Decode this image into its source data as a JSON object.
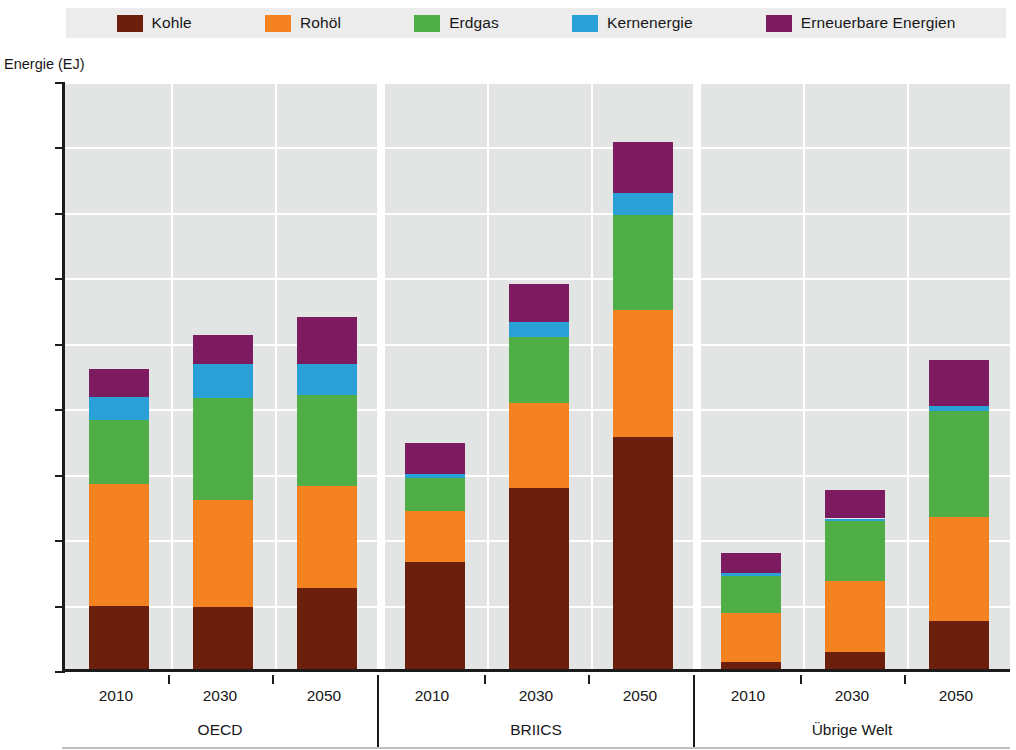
{
  "chart_data": {
    "type": "bar",
    "subtype": "stacked-bar-grouped",
    "title": "",
    "xlabel": "",
    "ylabel": "Energie (EJ)",
    "ylim": [
      0,
      450
    ],
    "ytick_step": 50,
    "yticks": [
      0,
      50,
      100,
      150,
      200,
      250,
      300,
      350,
      400,
      450
    ],
    "grid": "horizontal-and-vertical",
    "legend_position": "top",
    "groups": [
      "OECD",
      "BRIICS",
      "Übrige Welt"
    ],
    "categories": [
      "2010",
      "2030",
      "2050",
      "2010",
      "2030",
      "2050",
      "2010",
      "2030",
      "2050"
    ],
    "series": [
      {
        "name": "Kohle",
        "color": "#6B1F0C",
        "values": [
          48,
          47,
          62,
          82,
          138,
          177,
          5,
          13,
          37
        ]
      },
      {
        "name": "Rohöl",
        "color": "#F58220",
        "values": [
          93,
          82,
          78,
          39,
          65,
          97,
          38,
          54,
          79
        ]
      },
      {
        "name": "Erdgas",
        "color": "#4FAF46",
        "values": [
          49,
          78,
          69,
          25,
          51,
          73,
          28,
          46,
          81
        ]
      },
      {
        "name": "Kernenergie",
        "color": "#29A0D6",
        "values": [
          18,
          26,
          24,
          3,
          11,
          17,
          2,
          2,
          4
        ]
      },
      {
        "name": "Erneuerbare Energien",
        "color": "#7C1B60",
        "values": [
          21,
          22,
          36,
          24,
          29,
          39,
          16,
          22,
          35
        ]
      }
    ],
    "totals": [
      229,
      255,
      269,
      173,
      294,
      403,
      89,
      137,
      236
    ]
  },
  "legend": {
    "items": [
      {
        "label": "Kohle",
        "color": "#6B1F0C",
        "icon": "legend-swatch-icon"
      },
      {
        "label": "Rohöl",
        "color": "#F58220",
        "icon": "legend-swatch-icon"
      },
      {
        "label": "Erdgas",
        "color": "#4FAF46",
        "icon": "legend-swatch-icon"
      },
      {
        "label": "Kernenergie",
        "color": "#29A0D6",
        "icon": "legend-swatch-icon"
      },
      {
        "label": "Erneuerbare Energien",
        "color": "#7C1B60",
        "icon": "legend-swatch-icon"
      }
    ]
  },
  "axes": {
    "y_axis_title": "Energie (EJ)",
    "y_tick_labels": [
      "450",
      "400",
      "350",
      "300",
      "250",
      "200",
      "150",
      "100",
      "50",
      "0"
    ],
    "x_tick_labels": [
      "2010",
      "2030",
      "2050",
      "2010",
      "2030",
      "2050",
      "2010",
      "2030",
      "2050"
    ],
    "x_group_labels": [
      "OECD",
      "BRIICS",
      "Übrige Welt"
    ]
  },
  "colors": {
    "plot_background": "#e3e4e4",
    "legend_background": "#ececec",
    "gridline": "#ffffff",
    "axis": "#1b1b1b",
    "text": "#17171a"
  }
}
